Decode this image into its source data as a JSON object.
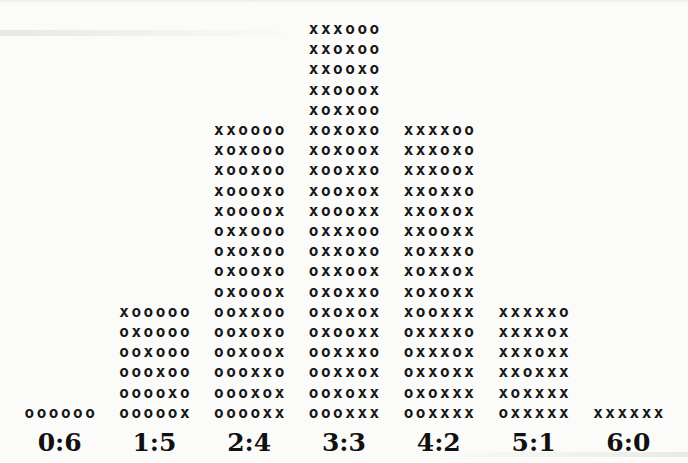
{
  "chart_data": {
    "type": "bar",
    "title": "",
    "xlabel": "",
    "ylabel": "",
    "legend": "none",
    "grid": false,
    "categories": [
      "0:6",
      "1:5",
      "2:4",
      "3:3",
      "4:2",
      "5:1",
      "6:0"
    ],
    "values": [
      1,
      6,
      15,
      20,
      15,
      6,
      1
    ],
    "ylim": [
      0,
      20
    ],
    "symbol_colors": {
      "text": "#161616",
      "background": "#fbfbf9"
    },
    "columns": [
      {
        "label": "0:6",
        "count": 1,
        "rows": [
          "oooooo"
        ]
      },
      {
        "label": "1:5",
        "count": 6,
        "rows": [
          "xooooo",
          "oxoooo",
          "ooxooo",
          "oooxoo",
          "ooooxo",
          "ooooox"
        ]
      },
      {
        "label": "2:4",
        "count": 15,
        "rows": [
          "xxoooo",
          "xoxooo",
          "xooxoo",
          "xoooxo",
          "xoooox",
          "oxxooo",
          "oxoxoo",
          "oxooxo",
          "oxooox",
          "ooxxoo",
          "ooxoxo",
          "ooxoox",
          "oooxxo",
          "oooxox",
          "ooooxx"
        ]
      },
      {
        "label": "3:3",
        "count": 20,
        "rows": [
          "xxxooo",
          "xxoxoo",
          "xxooxo",
          "xxooox",
          "xoxxoo",
          "xoxoxo",
          "xoxoox",
          "xooxxo",
          "xooxox",
          "xoooxx",
          "oxxxoo",
          "oxxoxo",
          "oxxoox",
          "oxoxxo",
          "oxoxox",
          "oxooxx",
          "ooxxxo",
          "ooxxox",
          "ooxoxx",
          "oooxxx"
        ]
      },
      {
        "label": "4:2",
        "count": 15,
        "rows": [
          "xxxxoo",
          "xxxoxo",
          "xxxoox",
          "xxoxxo",
          "xxoxox",
          "xxooxx",
          "xoxxxo",
          "xoxxox",
          "xoxoxx",
          "xooxxx",
          "oxxxxo",
          "oxxxox",
          "oxxoxx",
          "oxoxxx",
          "ooxxxx"
        ]
      },
      {
        "label": "5:1",
        "count": 6,
        "rows": [
          "xxxxxo",
          "xxxxox",
          "xxxoxx",
          "xxoxxx",
          "xoxxxx",
          "oxxxxx"
        ]
      },
      {
        "label": "6:0",
        "count": 1,
        "rows": [
          "xxxxxx"
        ]
      }
    ]
  }
}
